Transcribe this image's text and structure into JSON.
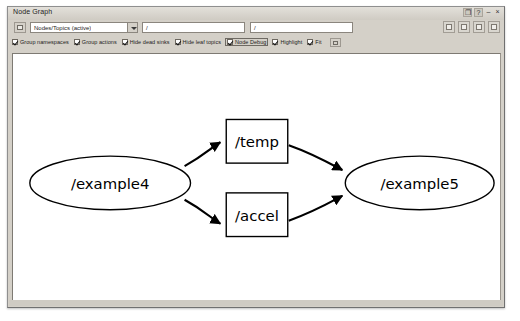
{
  "window": {
    "title": "Node Graph",
    "controls": [
      {
        "name": "undock-button",
        "glyph": "❐"
      },
      {
        "name": "help-button",
        "glyph": "?"
      },
      {
        "name": "minimize-button",
        "glyph": "–"
      },
      {
        "name": "close-button",
        "glyph": "×"
      }
    ]
  },
  "toolbar": {
    "refresh_button": "refresh-icon",
    "graph_type_combo": {
      "selected": "Nodes/Topics (active)",
      "options": [
        "Nodes only",
        "Nodes/Topics (active)",
        "Nodes/Topics (all)"
      ]
    },
    "namespace_filter": {
      "value": "/",
      "placeholder": "/"
    },
    "topic_filter": {
      "value": "/",
      "placeholder": "/"
    },
    "buttons": [
      {
        "name": "zoom-fit-button",
        "label": "Fit in view"
      },
      {
        "name": "save-dot-button",
        "label": "Save as DOT"
      },
      {
        "name": "save-image-button",
        "label": "Save as image"
      },
      {
        "name": "load-button",
        "label": "Load"
      }
    ],
    "checkboxes": [
      {
        "name": "group-namespaces-checkbox",
        "label": "Group namespaces",
        "checked": true,
        "focused": false
      },
      {
        "name": "group-actions-checkbox",
        "label": "Group actions",
        "checked": true,
        "focused": false
      },
      {
        "name": "hide-dead-sinks-checkbox",
        "label": "Hide dead sinks",
        "checked": true,
        "focused": false
      },
      {
        "name": "hide-leaf-topics-checkbox",
        "label": "Hide leaf topics",
        "checked": true,
        "focused": false
      },
      {
        "name": "node-debug-checkbox",
        "label": "Node Debug",
        "checked": true,
        "focused": true
      },
      {
        "name": "highlight-checkbox",
        "label": "Highlight",
        "checked": true,
        "focused": false
      },
      {
        "name": "fit-checkbox",
        "label": "Fit",
        "checked": true,
        "focused": false
      }
    ],
    "extra_button": "options-button"
  },
  "graph": {
    "nodes": [
      {
        "id": "example4",
        "label": "/example4",
        "shape": "ellipse",
        "cx": 97,
        "cy": 130,
        "rx": 81,
        "ry": 27
      },
      {
        "id": "temp",
        "label": "/temp",
        "shape": "rect",
        "x": 214,
        "y": 66,
        "w": 62,
        "h": 44
      },
      {
        "id": "accel",
        "label": "/accel",
        "shape": "rect",
        "x": 214,
        "y": 140,
        "w": 62,
        "h": 44
      },
      {
        "id": "example5",
        "label": "/example5",
        "shape": "ellipse",
        "cx": 409,
        "cy": 130,
        "rx": 75,
        "ry": 27
      }
    ],
    "edges": [
      {
        "from": "example4",
        "to": "temp"
      },
      {
        "from": "example4",
        "to": "accel"
      },
      {
        "from": "temp",
        "to": "example5"
      },
      {
        "from": "accel",
        "to": "example5"
      }
    ]
  }
}
